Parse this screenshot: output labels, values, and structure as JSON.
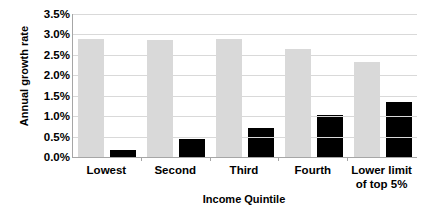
{
  "chart_data": {
    "type": "bar",
    "title": "",
    "xlabel": "Income Quintile",
    "ylabel": "Annual growth rate",
    "categories": [
      "Lowest",
      "Second",
      "Third",
      "Fourth",
      "Lower limit of top 5%"
    ],
    "series": [
      {
        "name": "series-light",
        "color": "#d9d9d9",
        "values": [
          2.9,
          2.87,
          2.9,
          2.65,
          2.32
        ]
      },
      {
        "name": "series-dark",
        "color": "#000000",
        "values": [
          0.16,
          0.43,
          0.71,
          1.02,
          1.35
        ]
      }
    ],
    "ylim": [
      0.0,
      3.5
    ],
    "ytick_values": [
      0.0,
      0.5,
      1.0,
      1.5,
      2.0,
      2.5,
      3.0,
      3.5
    ],
    "ytick_labels": [
      "0.0%",
      "0.5%",
      "1.0%",
      "1.5%",
      "2.0%",
      "2.5%",
      "3.0%",
      "3.5%"
    ],
    "grid": true,
    "legend": "none",
    "value_unit": "%"
  }
}
